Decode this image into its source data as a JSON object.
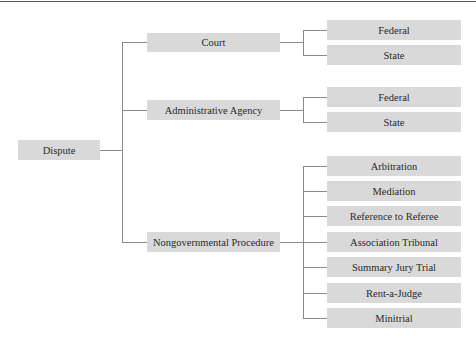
{
  "diagram": {
    "root": {
      "label": "Dispute"
    },
    "branches": [
      {
        "label": "Court",
        "children": [
          "Federal",
          "State"
        ]
      },
      {
        "label": "Administrative Agency",
        "children": [
          "Federal",
          "State"
        ]
      },
      {
        "label": "Nongovernmental Procedure",
        "children": [
          "Arbitration",
          "Mediation",
          "Reference to Referee",
          "Association Tribunal",
          "Summary Jury Trial",
          "Rent-a-Judge",
          "Minitrial"
        ]
      }
    ]
  },
  "colors": {
    "box_fill": "#d9d9d9",
    "connector": "#8a8a8a",
    "text": "#2a2a2a"
  }
}
